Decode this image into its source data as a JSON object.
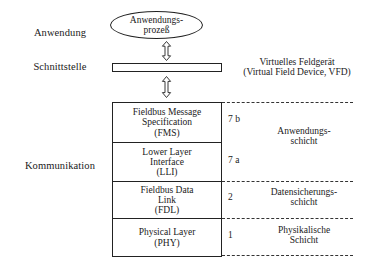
{
  "diagram": {
    "stages": [
      {
        "id": "anwendung",
        "label": "Anwendung",
        "x": 22,
        "y": 27
      },
      {
        "id": "schnittstelle",
        "label": "Schnittstelle",
        "x": 22,
        "y": 61
      },
      {
        "id": "kommunikation",
        "label": "Kommunikation",
        "x": 16,
        "y": 160
      }
    ],
    "application_process": {
      "label": "Anwendungs-\nprozeß"
    },
    "interface_bar": {
      "label": ""
    },
    "vfd_caption": "Virtuelles Feldgerät\n(Virtual Field Device, VFD)",
    "arrows": [
      {
        "id": "arrow-process-to-interface",
        "x": 161,
        "y": 41,
        "height": 20
      },
      {
        "id": "arrow-interface-to-stack",
        "x": 161,
        "y": 76,
        "height": 22
      }
    ],
    "stack_layers": [
      {
        "id": "fms",
        "label": "Fieldbus Message\nSpecification\n(FMS)",
        "height": 40
      },
      {
        "id": "lli",
        "label": "Lower Layer\nInterface\n(LLI)",
        "height": 39
      },
      {
        "id": "fdl",
        "label": "Fieldbus Data\nLink\n(FDL)",
        "height": 37
      },
      {
        "id": "phy",
        "label": "Physical Layer\n(PHY)",
        "height": 37
      }
    ],
    "osi_numbers": [
      {
        "id": "osi-num-7b",
        "value": "7 b",
        "y": 114
      },
      {
        "id": "osi-num-7a",
        "value": "7 a",
        "y": 155
      },
      {
        "id": "osi-num-2",
        "value": "2",
        "y": 192
      },
      {
        "id": "osi-num-1",
        "value": "1",
        "y": 230
      }
    ],
    "osi_names": [
      {
        "id": "osi-name-application",
        "label": "Anwendungs-\nschicht",
        "y": 126
      },
      {
        "id": "osi-name-datalink",
        "label": "Datensicherungs-\nschicht",
        "y": 187
      },
      {
        "id": "osi-name-physical",
        "label": "Physikalische\nSchicht",
        "y": 225
      }
    ],
    "dashed_separators": [
      {
        "id": "dashed-top",
        "y": 102
      },
      {
        "id": "dashed-app-dl",
        "y": 181
      },
      {
        "id": "dashed-dl-phy",
        "y": 218
      },
      {
        "id": "dashed-bottom",
        "y": 255
      }
    ],
    "colors": {
      "line": "#222222",
      "background": "#ffffff",
      "text": "#1a1a1a"
    }
  }
}
